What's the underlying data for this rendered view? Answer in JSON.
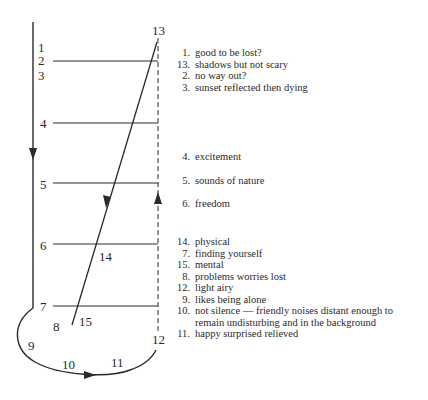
{
  "diagram": {
    "axis_labels": {
      "left": [
        "1",
        "2",
        "3",
        "4",
        "5",
        "6",
        "7",
        "8",
        "9",
        "10",
        "11"
      ],
      "right_top": "13",
      "right_bottom": "12",
      "diagonal_mid": "14",
      "diagonal_bottom": "15"
    }
  },
  "legend": {
    "group1": [
      {
        "n": "1.",
        "text": "good to be lost?"
      },
      {
        "n": "13.",
        "text": "shadows but not scary"
      },
      {
        "n": "2.",
        "text": "no way out?"
      },
      {
        "n": "3.",
        "text": "sunset reflected then dying"
      }
    ],
    "group2": [
      {
        "n": "4.",
        "text": "excitement"
      },
      {
        "n": "5.",
        "text": "sounds of nature"
      },
      {
        "n": "6.",
        "text": "freedom"
      }
    ],
    "group3": [
      {
        "n": "14.",
        "text": "physical"
      },
      {
        "n": "7.",
        "text": "finding yourself"
      },
      {
        "n": "15.",
        "text": "mental"
      },
      {
        "n": "8.",
        "text": "problems worries lost"
      },
      {
        "n": "12.",
        "text": "light airy"
      },
      {
        "n": "9.",
        "text": "likes being alone"
      },
      {
        "n": "10.",
        "text": "not silence — friendly noises distant enough to remain undisturbing  and in the background"
      },
      {
        "n": "11.",
        "text": "happy surprised relieved"
      }
    ]
  }
}
